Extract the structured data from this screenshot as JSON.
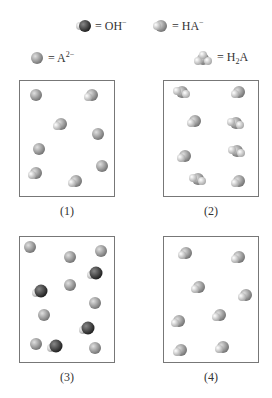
{
  "legend": {
    "oh": {
      "text": "= OH",
      "sup": "−"
    },
    "ha": {
      "text": "= HA",
      "sup": "−"
    },
    "a2": {
      "text": "= A",
      "sup": "2−"
    },
    "h2a": {
      "pre": "= H",
      "sub": "2",
      "post": "A"
    }
  },
  "colors": {
    "A_sphere": "#9a9a9a",
    "O_sphere": "#3a3a3a",
    "H_sphere": "#d8d8d8",
    "box_border": "#777777"
  },
  "panels": [
    {
      "label": "(1)",
      "molecules": [
        {
          "type": "A",
          "x": 16,
          "y": 14
        },
        {
          "type": "HA",
          "x": 71,
          "y": 14
        },
        {
          "type": "HA",
          "x": 40,
          "y": 43
        },
        {
          "type": "A",
          "x": 78,
          "y": 53
        },
        {
          "type": "A",
          "x": 19,
          "y": 68
        },
        {
          "type": "A",
          "x": 82,
          "y": 85
        },
        {
          "type": "HA",
          "x": 15,
          "y": 92
        },
        {
          "type": "HA",
          "x": 55,
          "y": 100
        }
      ]
    },
    {
      "label": "(2)",
      "molecules": [
        {
          "type": "H2A",
          "x": 18,
          "y": 11
        },
        {
          "type": "HA",
          "x": 74,
          "y": 11
        },
        {
          "type": "HA",
          "x": 30,
          "y": 40
        },
        {
          "type": "H2A",
          "x": 72,
          "y": 42
        },
        {
          "type": "HA",
          "x": 20,
          "y": 75
        },
        {
          "type": "H2A",
          "x": 73,
          "y": 70
        },
        {
          "type": "H2A",
          "x": 34,
          "y": 98
        },
        {
          "type": "HA",
          "x": 74,
          "y": 100
        }
      ]
    },
    {
      "label": "(3)",
      "molecules": [
        {
          "type": "A",
          "x": 10,
          "y": 10
        },
        {
          "type": "A",
          "x": 50,
          "y": 20
        },
        {
          "type": "A",
          "x": 81,
          "y": 14
        },
        {
          "type": "OH",
          "x": 75,
          "y": 36
        },
        {
          "type": "OH",
          "x": 20,
          "y": 54
        },
        {
          "type": "A",
          "x": 50,
          "y": 48
        },
        {
          "type": "A",
          "x": 75,
          "y": 66
        },
        {
          "type": "A",
          "x": 24,
          "y": 78
        },
        {
          "type": "OH",
          "x": 67,
          "y": 91
        },
        {
          "type": "A",
          "x": 16,
          "y": 107
        },
        {
          "type": "OH",
          "x": 35,
          "y": 109
        },
        {
          "type": "A",
          "x": 75,
          "y": 111
        }
      ]
    },
    {
      "label": "(4)",
      "molecules": [
        {
          "type": "HA",
          "x": 21,
          "y": 16
        },
        {
          "type": "HA",
          "x": 74,
          "y": 20
        },
        {
          "type": "HA",
          "x": 34,
          "y": 50
        },
        {
          "type": "HA",
          "x": 81,
          "y": 58
        },
        {
          "type": "HA",
          "x": 14,
          "y": 84
        },
        {
          "type": "HA",
          "x": 55,
          "y": 78
        },
        {
          "type": "HA",
          "x": 16,
          "y": 113
        },
        {
          "type": "HA",
          "x": 58,
          "y": 110
        }
      ]
    }
  ]
}
